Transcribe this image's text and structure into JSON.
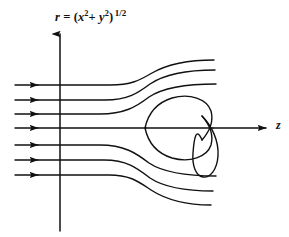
{
  "figure": {
    "background_color": "#ffffff",
    "stroke_color": "#111111",
    "width": 289,
    "height": 237,
    "axes": {
      "vertical": {
        "name": "r",
        "label_text": "r",
        "label_equals": "=",
        "label_open": "(",
        "label_x": "x",
        "label_x_exp": "2",
        "label_plus": "+",
        "label_y": "y",
        "label_y_exp": "2",
        "label_close": ")",
        "label_power": "1/2",
        "label_full": "r = (x2+ y2) 1/2",
        "x": 60,
        "top": 32,
        "bottom": 231,
        "arrow": "up"
      },
      "horizontal": {
        "name": "z",
        "label_text": "z",
        "y": 128,
        "left": 14,
        "right": 268,
        "arrow": "right"
      }
    },
    "streamlines": {
      "count": 7,
      "inlet_x": 15,
      "arrowhead_x": 38,
      "rows_y": [
        85,
        100,
        114,
        129,
        145,
        160,
        175
      ]
    },
    "body": {
      "type": "closed-body-with-loop",
      "nose_x": 145,
      "nose_y": 128,
      "top_y": 96,
      "right_x": 213,
      "loop_bottom_y": 177
    }
  }
}
